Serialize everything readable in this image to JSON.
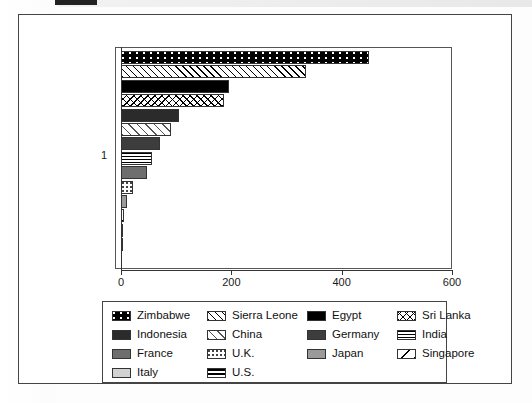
{
  "chart_data": {
    "type": "bar",
    "orientation": "horizontal",
    "title": "",
    "xlabel": "",
    "ylabel": "1",
    "xlim": [
      0,
      600
    ],
    "xticks": [
      0,
      200,
      400,
      600
    ],
    "xtick_labels": [
      "0",
      "200",
      "400",
      "600"
    ],
    "ytick_labels": [
      "1"
    ],
    "grid": false,
    "legend_position": "below-plot",
    "categories": [
      "Zimbabwe",
      "Sierra Leone",
      "Egypt",
      "Sri Lanka",
      "Indonesia",
      "China",
      "Germany",
      "India",
      "France",
      "U.K.",
      "Japan",
      "Singapore",
      "Italy",
      "U.S."
    ],
    "values": [
      450,
      335,
      196,
      187,
      105,
      91,
      71,
      57,
      47,
      22,
      11,
      6,
      3,
      1
    ],
    "patterns": [
      "black-with-white-dots",
      "diagonal-hatch-right",
      "solid-black",
      "crosshatch",
      "dark-gray-solid",
      "light-diagonal-hatch",
      "dark-gray-solid-2",
      "horizontal-lines",
      "medium-gray-solid",
      "sparse-dots",
      "gray-solid",
      "single-diagonal-line",
      "light-gray-solid",
      "thick-horizontal-lines"
    ]
  },
  "legend": {
    "entries": [
      {
        "label": "Zimbabwe",
        "pattern_class": "pat-dots-on-black"
      },
      {
        "label": "Sierra Leone",
        "pattern_class": "pat-diag-right"
      },
      {
        "label": "Egypt",
        "pattern_class": "pat-solid-black"
      },
      {
        "label": "Sri Lanka",
        "pattern_class": "pat-crosshatch"
      },
      {
        "label": "Indonesia",
        "pattern_class": "pat-dark-gray"
      },
      {
        "label": "China",
        "pattern_class": "pat-diag-light"
      },
      {
        "label": "Germany",
        "pattern_class": "pat-mid-dark"
      },
      {
        "label": "India",
        "pattern_class": "pat-horiz-lines"
      },
      {
        "label": "France",
        "pattern_class": "pat-med-gray"
      },
      {
        "label": "U.K.",
        "pattern_class": "pat-dots-sparse"
      },
      {
        "label": "Japan",
        "pattern_class": "pat-gray"
      },
      {
        "label": "Singapore",
        "pattern_class": "pat-diag-single"
      },
      {
        "label": "Italy",
        "pattern_class": "pat-light-gray"
      },
      {
        "label": "U.S.",
        "pattern_class": "pat-thick-horiz"
      }
    ]
  },
  "colors": {
    "axis": "#333333",
    "frame": "#444444",
    "background": "#ffffff",
    "text": "#111111"
  }
}
